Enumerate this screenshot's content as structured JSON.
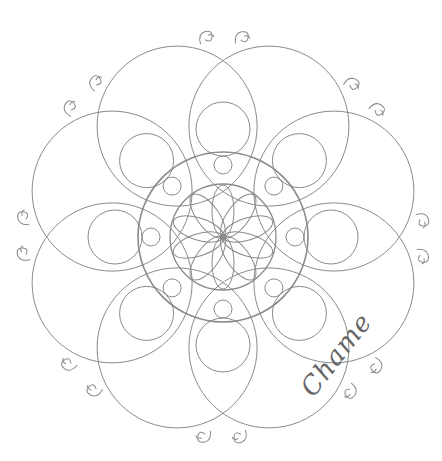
{
  "artwork": {
    "type": "mandala line drawing",
    "stroke_color": "#8a8a8a",
    "background": "#ffffff",
    "center": [
      223,
      237
    ],
    "inner_flower_petals": 10,
    "outer_loops": 8,
    "decoration_pairs": 8
  },
  "signature": {
    "text": "Chame"
  }
}
